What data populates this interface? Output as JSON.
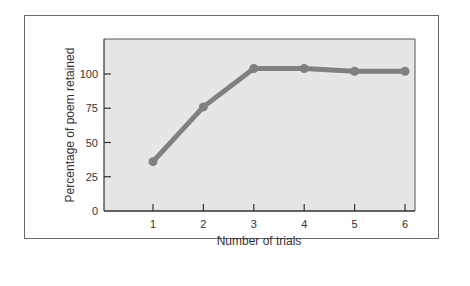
{
  "chart_data": {
    "type": "line",
    "title": "",
    "xlabel": "Number of trials",
    "ylabel": "Percentage of poem retained",
    "x": [
      1,
      2,
      3,
      4,
      5,
      6
    ],
    "series": [
      {
        "name": "Percentage of poem retained",
        "values": [
          36,
          76,
          104,
          104,
          102,
          102
        ]
      }
    ],
    "xticks": [
      "1",
      "2",
      "3",
      "4",
      "5",
      "6"
    ],
    "yticks": [
      "0",
      "25",
      "50",
      "75",
      "100"
    ],
    "ylim": [
      0,
      125
    ],
    "xlim": [
      0,
      6.2
    ],
    "grid": false,
    "legend": null,
    "colors": {
      "line": "#808080",
      "plot_bg": "#e6e6e6",
      "axis": "#333333"
    }
  }
}
